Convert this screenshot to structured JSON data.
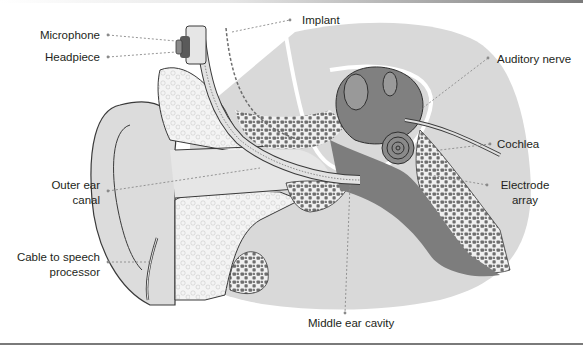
{
  "figure": {
    "labels": {
      "microphone": "Microphone",
      "headpiece": "Headpiece",
      "implant": "Implant",
      "auditory_nerve": "Auditory nerve",
      "cochlea": "Cochlea",
      "electrode_array_1": "Electrode",
      "electrode_array_2": "array",
      "outer_ear_canal_1": "Outer ear",
      "outer_ear_canal_2": "canal",
      "cable_1": "Cable to speech",
      "cable_2": "processor",
      "middle_ear_cavity": "Middle ear cavity"
    },
    "colors": {
      "skin": "#d9d9d9",
      "bone_light": "#f2f2f2",
      "bone_dark": "#6b6b6b",
      "tissue_dark": "#7d7d7d",
      "outline": "#3a3a3a",
      "leader": "#8a8a8a"
    }
  }
}
